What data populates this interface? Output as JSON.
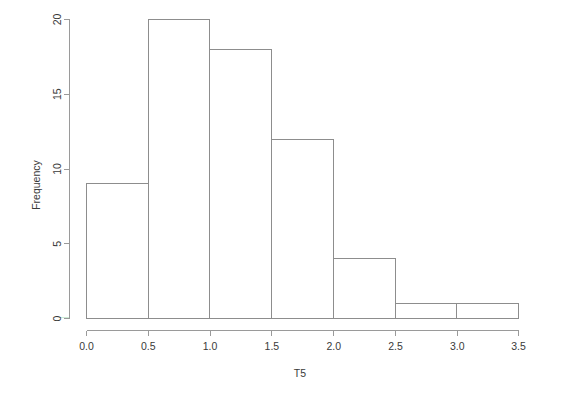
{
  "chart_data": {
    "type": "bar",
    "title": "",
    "subtitle": "",
    "xlabel": "T5",
    "ylabel": "Frequency",
    "categories": [
      "0.0-0.5",
      "0.5-1.0",
      "1.0-1.5",
      "1.5-2.0",
      "2.0-2.5",
      "2.5-3.0",
      "3.0-3.5"
    ],
    "bin_edges": [
      0.0,
      0.5,
      1.0,
      1.5,
      2.0,
      2.5,
      3.0,
      3.5
    ],
    "values": [
      9,
      20,
      18,
      12,
      4,
      1,
      1
    ],
    "bin_width": 0.5,
    "xlim": [
      0.0,
      3.5
    ],
    "ylim": [
      0,
      20
    ],
    "xticks": [
      "0.0",
      "0.5",
      "1.0",
      "1.5",
      "2.0",
      "2.5",
      "3.0",
      "3.5"
    ],
    "xtick_values": [
      0.0,
      0.5,
      1.0,
      1.5,
      2.0,
      2.5,
      3.0,
      3.5
    ],
    "yticks": [
      "0",
      "5",
      "10",
      "15",
      "20"
    ],
    "ytick_values": [
      0,
      5,
      10,
      15,
      20
    ],
    "grid": false,
    "legend": false,
    "legend_position": "none",
    "total_count": 65,
    "colors": {
      "bar_stroke": "#8d8d8d",
      "bar_fill": "none",
      "axis": "#9a9a9a",
      "text": "#3a3a3a",
      "background": "#ffffff"
    },
    "ylabel_rotation": -90
  },
  "axes": {
    "x_title": "T5",
    "y_title": "Frequency"
  }
}
